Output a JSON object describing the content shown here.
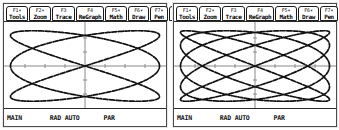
{
  "screens": [
    {
      "id": "left-screen",
      "toolbar": {
        "buttons": [
          {
            "fkey": "F1",
            "arrow": "▾",
            "label": "Tools",
            "name": "tools"
          },
          {
            "fkey": "F2",
            "arrow": "▾",
            "label": "Zoom",
            "name": "zoom"
          },
          {
            "fkey": "F3",
            "arrow": "",
            "label": "Trace",
            "name": "trace"
          },
          {
            "fkey": "F4",
            "arrow": "",
            "label": "ReGraph",
            "name": "regraph"
          },
          {
            "fkey": "F5",
            "arrow": "▾",
            "label": "Math",
            "name": "math"
          },
          {
            "fkey": "F6",
            "arrow": "▾",
            "label": "Draw",
            "name": "draw"
          },
          {
            "fkey": "F7",
            "arrow": "▾",
            "label": "Pen",
            "name": "pen"
          }
        ],
        "overflow_label": "⋮"
      },
      "status": {
        "left": "MAIN",
        "center": "RAD AUTO",
        "right": "PAR"
      }
    },
    {
      "id": "right-screen",
      "toolbar": {
        "buttons": [
          {
            "fkey": "F1",
            "arrow": "▾",
            "label": "Tools",
            "name": "tools"
          },
          {
            "fkey": "F2",
            "arrow": "▾",
            "label": "Zoom",
            "name": "zoom"
          },
          {
            "fkey": "F3",
            "arrow": "",
            "label": "Trace",
            "name": "trace"
          },
          {
            "fkey": "F4",
            "arrow": "",
            "label": "ReGraph",
            "name": "regraph"
          },
          {
            "fkey": "F5",
            "arrow": "▾",
            "label": "Math",
            "name": "math"
          },
          {
            "fkey": "F6",
            "arrow": "▾",
            "label": "Draw",
            "name": "draw"
          },
          {
            "fkey": "F7",
            "arrow": "▾",
            "label": "Pen",
            "name": "pen"
          }
        ],
        "overflow_label": "⋮"
      },
      "status": {
        "left": "MAIN",
        "center": "RAD AUTO",
        "right": "PAR"
      }
    }
  ],
  "chart_data": [
    {
      "type": "line",
      "title": "",
      "xlabel": "",
      "ylabel": "",
      "curve": "lissajous",
      "mode": "parametric",
      "xt": "a*cos(3t)",
      "yt": "b*sin(2t)",
      "freq_x": 3,
      "freq_y": 2,
      "phase": 0,
      "amplitude_x": 0.92,
      "amplitude_y": 0.82,
      "t_range": [
        0,
        6.2831853
      ],
      "xlim": [
        -1,
        1
      ],
      "ylim": [
        -1,
        1
      ],
      "grid": false,
      "axes": true,
      "axis_ticks_x": [
        -0.75,
        -0.5,
        -0.25,
        0.25,
        0.5,
        0.75
      ],
      "axis_ticks_y": [
        -0.75,
        -0.5,
        -0.25,
        0.25,
        0.5,
        0.75
      ],
      "stroke": "#111111",
      "axis_color": "#8a8a8a"
    },
    {
      "type": "line",
      "title": "",
      "xlabel": "",
      "ylabel": "",
      "curve": "lissajous",
      "mode": "parametric",
      "xt": "a*cos(5t)",
      "yt": "b*sin(4t)",
      "freq_x": 5,
      "freq_y": 4,
      "phase": 0,
      "amplitude_x": 0.92,
      "amplitude_y": 0.82,
      "t_range": [
        0,
        6.2831853
      ],
      "xlim": [
        -1,
        1
      ],
      "ylim": [
        -1,
        1
      ],
      "grid": false,
      "axes": true,
      "axis_ticks_x": [
        -0.75,
        -0.5,
        -0.25,
        0.25,
        0.5,
        0.75
      ],
      "axis_ticks_y": [
        -0.75,
        -0.5,
        -0.25,
        0.25,
        0.5,
        0.75
      ],
      "stroke": "#111111",
      "axis_color": "#8a8a8a"
    }
  ],
  "colors": {
    "frame": "#4a4a4a",
    "ink": "#111111",
    "paper": "#ffffff",
    "axis": "#8a8a8a"
  }
}
